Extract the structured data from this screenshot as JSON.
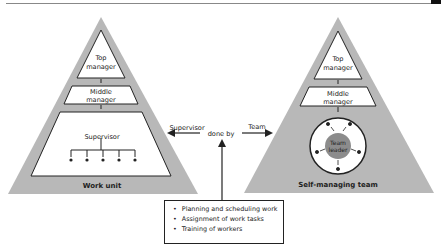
{
  "left_pyramid": {
    "top_label_1": "Top",
    "top_label_2": "manager",
    "middle_label_1": "Middle",
    "middle_label_2": "manager",
    "supervisor_label": "Supervisor",
    "caption": "Work unit"
  },
  "right_pyramid": {
    "top_label_1": "Top",
    "top_label_2": "manager",
    "middle_label_1": "Middle",
    "middle_label_2": "manager",
    "leader_label_1": "Team",
    "leader_label_2": "leader",
    "caption": "Self-managing team"
  },
  "connector": {
    "left_label": "Supervisor",
    "center_label": "done by",
    "right_label": "Team"
  },
  "tasks": {
    "items": [
      "Planning and scheduling work",
      "Assignment of work tasks",
      "Training of workers"
    ]
  },
  "colors": {
    "pyramid_fill": "#b8b8b8",
    "leader_fill": "#8c8c8c",
    "line": "#222222"
  }
}
